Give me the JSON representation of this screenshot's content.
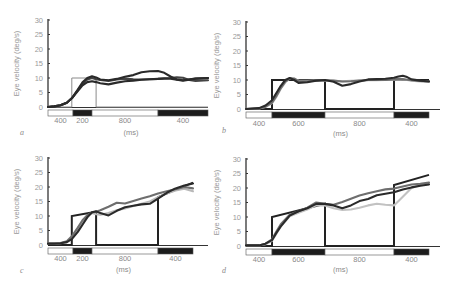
{
  "figure": {
    "y_label": "Eye velocity (deg/s)",
    "x_label": "(ms)",
    "y_ticks": [
      "0",
      "5",
      "10",
      "15",
      "20",
      "25",
      "30"
    ]
  },
  "chart_data": [
    {
      "panel": "a",
      "type": "line",
      "title": "",
      "xlabel": "(ms)",
      "ylabel": "Eye velocity (deg/s)",
      "ylim": [
        0,
        30
      ],
      "y_ticks": [
        0,
        5,
        10,
        15,
        20,
        25,
        30
      ],
      "grid": false,
      "stimulus_segments": [
        {
          "label": "400",
          "fill": "white",
          "start_ms": 0,
          "end_ms": 400
        },
        {
          "label": "200",
          "fill": "black",
          "start_ms": 400,
          "end_ms": 600
        },
        {
          "label": "800",
          "fill": "white",
          "start_ms": 600,
          "end_ms": 1400
        },
        {
          "label": "400",
          "fill": "black",
          "start_ms": 1400,
          "end_ms": 1800
        }
      ],
      "target_velocity": {
        "x_ms": [
          0,
          380,
          380,
          650,
          650,
          1400,
          1400,
          1800
        ],
        "y": [
          0,
          0,
          10,
          10,
          0,
          0,
          0,
          0
        ],
        "color": "#888888"
      },
      "x_ms": [
        0,
        100,
        200,
        300,
        380,
        450,
        500,
        550,
        600,
        650,
        700,
        800,
        900,
        1000,
        1100,
        1200,
        1300,
        1400,
        1450,
        1500,
        1550,
        1600,
        1650,
        1700,
        1800
      ],
      "series": [
        {
          "name": "trace 1",
          "color": "#2a2a2a",
          "values": [
            0,
            0.2,
            0.6,
            1.5,
            3,
            6,
            8.5,
            10,
            10.6,
            10.2,
            9.5,
            9.2,
            9.7,
            10.4,
            11,
            12,
            12.3,
            12.4,
            11.8,
            10.5,
            9.5,
            9.2,
            9.6,
            9.8,
            10
          ]
        },
        {
          "name": "trace 2",
          "color": "#2a2a2a",
          "values": [
            0,
            0.2,
            0.6,
            1.5,
            3,
            5.5,
            7.5,
            8.6,
            8.9,
            8.6,
            8.2,
            7.8,
            8.4,
            8.9,
            9.1,
            9.4,
            9.6,
            9.7,
            9.8,
            9.8,
            9.4,
            9.1,
            9.4,
            9.8,
            10
          ]
        },
        {
          "name": "trace 3",
          "color": "#444444",
          "values": [
            0,
            0.2,
            0.6,
            1.5,
            3,
            5.8,
            8,
            9.5,
            10,
            9.6,
            9.3,
            9,
            9.5,
            9.8,
            9.6,
            9.5,
            9.6,
            9.7,
            9.9,
            10,
            10.2,
            10.1,
            9.3,
            9,
            9.2
          ]
        }
      ]
    },
    {
      "panel": "b",
      "type": "line",
      "title": "",
      "xlabel": "(ms)",
      "ylabel": "",
      "ylim": [
        0,
        30
      ],
      "y_ticks": [
        0,
        5,
        10,
        15,
        20,
        25,
        30
      ],
      "grid": false,
      "stimulus_segments": [
        {
          "label": "400",
          "fill": "white",
          "start_ms": 0,
          "end_ms": 400
        },
        {
          "label": "600",
          "fill": "black",
          "start_ms": 400,
          "end_ms": 1000
        },
        {
          "label": "800",
          "fill": "white",
          "start_ms": 1000,
          "end_ms": 1800
        },
        {
          "label": "400",
          "fill": "black",
          "start_ms": 1800,
          "end_ms": 2200
        }
      ],
      "target_velocity": {
        "x_ms": [
          0,
          400,
          400,
          1000,
          1000,
          1800,
          1800,
          2200
        ],
        "y": [
          0,
          0,
          10,
          10,
          0,
          0,
          10,
          10
        ],
        "color": "#222222"
      },
      "x_ms": [
        0,
        200,
        300,
        400,
        450,
        500,
        550,
        600,
        650,
        700,
        800,
        900,
        1000,
        1100,
        1200,
        1300,
        1400,
        1500,
        1600,
        1700,
        1800,
        1850,
        1900,
        1950,
        2000,
        2100,
        2200
      ],
      "series": [
        {
          "name": "trace dark",
          "color": "#2a2a2a",
          "values": [
            0,
            0.3,
            1.2,
            3,
            5.5,
            8,
            10,
            10.7,
            10,
            9,
            9.2,
            9.8,
            10,
            9.4,
            8,
            8.6,
            9.5,
            10.2,
            10.3,
            10.4,
            10.8,
            11.2,
            11.5,
            11,
            10.2,
            9.8,
            9.5
          ]
        },
        {
          "name": "trace mid",
          "color": "#6e6e6e",
          "values": [
            0,
            0.2,
            0.8,
            2.2,
            4.5,
            7.2,
            9.4,
            10.6,
            10.5,
            9.6,
            9.6,
            9.8,
            9.9,
            9.8,
            9.5,
            9.6,
            9.8,
            10,
            10,
            10,
            10.2,
            10.4,
            10.3,
            10.1,
            9.9,
            9.7,
            9.6
          ]
        },
        {
          "name": "trace light",
          "color": "#b8b8b8",
          "values": [
            0,
            0.2,
            0.7,
            2,
            4.2,
            7,
            9.2,
            10.5,
            10.3,
            9.8,
            9.7,
            9.8,
            9.8,
            9.7,
            9.6,
            9.7,
            9.8,
            9.9,
            9.9,
            10,
            10.1,
            10.2,
            10.1,
            10,
            9.8,
            9.5,
            9.3
          ]
        }
      ]
    },
    {
      "panel": "c",
      "type": "line",
      "title": "",
      "xlabel": "(ms)",
      "ylabel": "Eye velocity (deg/s)",
      "ylim": [
        0,
        30
      ],
      "y_ticks": [
        0,
        5,
        10,
        15,
        20,
        25,
        30
      ],
      "grid": false,
      "stimulus_segments": [
        {
          "label": "400",
          "fill": "white",
          "start_ms": 0,
          "end_ms": 400
        },
        {
          "label": "200",
          "fill": "black",
          "start_ms": 400,
          "end_ms": 600
        },
        {
          "label": "800",
          "fill": "white",
          "start_ms": 600,
          "end_ms": 1400
        },
        {
          "label": "400",
          "fill": "black",
          "start_ms": 1400,
          "end_ms": 1800
        }
      ],
      "target_velocity": {
        "x_ms": [
          0,
          380,
          380,
          650,
          650,
          1400,
          1400,
          1800
        ],
        "y": [
          0,
          0,
          10,
          11.5,
          0,
          0,
          16.5,
          21.5
        ],
        "color": "#222222"
      },
      "x_ms": [
        0,
        100,
        200,
        300,
        380,
        450,
        500,
        550,
        600,
        650,
        700,
        800,
        900,
        1000,
        1100,
        1200,
        1300,
        1400,
        1500,
        1600,
        1700,
        1800
      ],
      "series": [
        {
          "name": "trace dark",
          "color": "#2a2a2a",
          "values": [
            0.5,
            0.5,
            0.6,
            1,
            2,
            4.5,
            7,
            9.5,
            11.3,
            11.6,
            11,
            10.2,
            11.8,
            13,
            13.5,
            14,
            14.2,
            16,
            18,
            19.5,
            20.5,
            21.2
          ]
        },
        {
          "name": "trace mid",
          "color": "#6e6e6e",
          "values": [
            0.5,
            0.5,
            0.7,
            1.3,
            3,
            6,
            8.5,
            10.3,
            11.2,
            11.5,
            12,
            13.2,
            14.6,
            14.3,
            15.2,
            16,
            16.8,
            17.8,
            18.5,
            19.2,
            20,
            19.5
          ]
        },
        {
          "name": "trace light",
          "color": "#b8b8b8",
          "values": [
            0.5,
            0.5,
            0.6,
            1,
            2.5,
            5.5,
            8,
            10,
            11,
            10.6,
            10.4,
            11,
            12,
            12.6,
            13.4,
            14.2,
            15,
            16.5,
            17.8,
            18.8,
            19.4,
            18.5
          ]
        }
      ]
    },
    {
      "panel": "d",
      "type": "line",
      "title": "",
      "xlabel": "(ms)",
      "ylabel": "",
      "ylim": [
        0,
        30
      ],
      "y_ticks": [
        0,
        5,
        10,
        15,
        20,
        25,
        30
      ],
      "grid": false,
      "stimulus_segments": [
        {
          "label": "400",
          "fill": "white",
          "start_ms": 0,
          "end_ms": 400
        },
        {
          "label": "600",
          "fill": "black",
          "start_ms": 400,
          "end_ms": 1000
        },
        {
          "label": "800",
          "fill": "white",
          "start_ms": 1000,
          "end_ms": 1800
        },
        {
          "label": "400",
          "fill": "black",
          "start_ms": 1800,
          "end_ms": 2200
        }
      ],
      "target_velocity": {
        "x_ms": [
          0,
          400,
          400,
          1000,
          1000,
          1800,
          1800,
          2200
        ],
        "y": [
          0,
          0,
          10,
          14.5,
          0,
          0,
          21,
          24.5
        ],
        "color": "#222222"
      },
      "x_ms": [
        0,
        200,
        300,
        400,
        450,
        500,
        600,
        700,
        800,
        900,
        1000,
        1100,
        1200,
        1300,
        1400,
        1500,
        1600,
        1700,
        1800,
        1900,
        2000,
        2100,
        2200
      ],
      "series": [
        {
          "name": "trace dark",
          "color": "#2a2a2a",
          "values": [
            0.2,
            0.2,
            0.8,
            2,
            4.5,
            6.8,
            10.5,
            12,
            13,
            14.5,
            14.5,
            14,
            13,
            14,
            15.5,
            16.2,
            17.5,
            18,
            18.5,
            19.5,
            20.2,
            20.8,
            21.2
          ]
        },
        {
          "name": "trace mid",
          "color": "#6e6e6e",
          "values": [
            0.2,
            0.2,
            0.8,
            2.3,
            5,
            7.5,
            10.8,
            12,
            13.2,
            15,
            14.5,
            14.2,
            15.2,
            16.3,
            17.4,
            18.2,
            18.9,
            19.5,
            19.8,
            20.5,
            21.2,
            21.5,
            21.9
          ]
        },
        {
          "name": "trace light",
          "color": "#c2c2c2",
          "values": [
            0.2,
            0.2,
            0.6,
            1.8,
            4.2,
            6.8,
            10.2,
            11.5,
            12.6,
            14,
            14,
            13,
            12.4,
            12.6,
            13.2,
            14,
            14.6,
            14.2,
            14,
            17,
            20,
            21,
            21.5
          ]
        }
      ]
    }
  ],
  "panels": [
    {
      "letter": "a",
      "x_label": "(ms)",
      "segments": [
        "400",
        "200",
        "800",
        "400"
      ]
    },
    {
      "letter": "b",
      "x_label": "(ms)",
      "segments": [
        "400",
        "600",
        "800",
        "400"
      ]
    },
    {
      "letter": "c",
      "x_label": "(ms)",
      "segments": [
        "400",
        "200",
        "800",
        "400"
      ]
    },
    {
      "letter": "d",
      "x_label": "(ms)",
      "segments": [
        "400",
        "600",
        "800",
        "400"
      ]
    }
  ]
}
